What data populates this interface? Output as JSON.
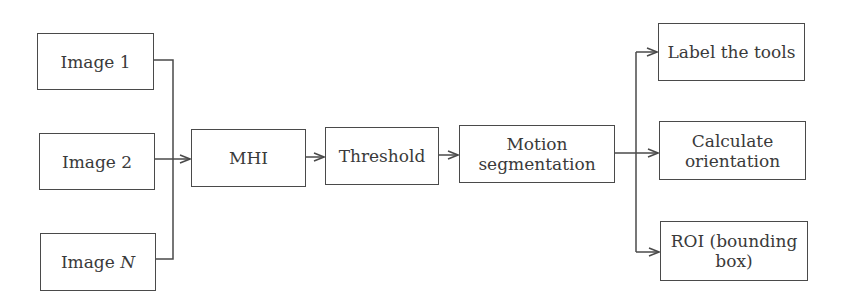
{
  "diagram": {
    "inputs": [
      {
        "label": "Image 1"
      },
      {
        "label": "Image 2"
      },
      {
        "label_prefix": "Image ",
        "label_var": "N"
      }
    ],
    "pipeline": [
      {
        "label": "MHI"
      },
      {
        "label": "Threshold"
      },
      {
        "line1": "Motion",
        "line2": "segmentation"
      }
    ],
    "outputs": [
      {
        "label": "Label the tools"
      },
      {
        "line1": "Calculate",
        "line2": "orientation"
      },
      {
        "line1": "ROI (bounding",
        "line2": "box)"
      }
    ],
    "colors": {
      "stroke": "#4a4a4a",
      "text": "#3a3a3a",
      "background": "#ffffff"
    }
  }
}
